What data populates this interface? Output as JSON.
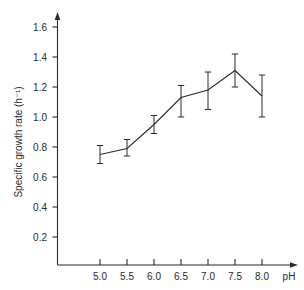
{
  "chart_data": {
    "type": "line",
    "title": "",
    "xlabel": "pH",
    "ylabel": "Specific growth rate (h⁻¹)",
    "x": [
      5.0,
      5.5,
      6.0,
      6.5,
      7.0,
      7.5,
      8.0
    ],
    "values": [
      0.75,
      0.79,
      0.95,
      1.13,
      1.18,
      1.31,
      1.14
    ],
    "error_low": [
      0.69,
      0.74,
      0.89,
      1.0,
      1.05,
      1.2,
      1.0
    ],
    "error_high": [
      0.81,
      0.85,
      1.01,
      1.21,
      1.3,
      1.42,
      1.28
    ],
    "xlim": [
      4.6,
      8.5
    ],
    "ylim": [
      0.0,
      1.7
    ],
    "xticks": [
      5.0,
      5.5,
      6.0,
      6.5,
      7.0,
      7.5,
      8.0
    ],
    "xtick_labels": [
      "5.0",
      "5.5",
      "6.0",
      "6.5",
      "7.0",
      "7.5",
      "8.0"
    ],
    "yticks": [
      0.2,
      0.4,
      0.6,
      0.8,
      1.0,
      1.2,
      1.4,
      1.6
    ],
    "ytick_labels": [
      "0.2",
      "0.4",
      "0.6",
      "0.8",
      "1.0",
      "1.2",
      "1.4",
      "1.6"
    ],
    "grid": false,
    "legend": "none",
    "markers": "error-bar-caps",
    "error_bar_style": "vertical-with-caps"
  },
  "axes": {
    "y_axis_title": "Specific growth rate (h⁻¹)",
    "x_axis_title": "pH"
  }
}
